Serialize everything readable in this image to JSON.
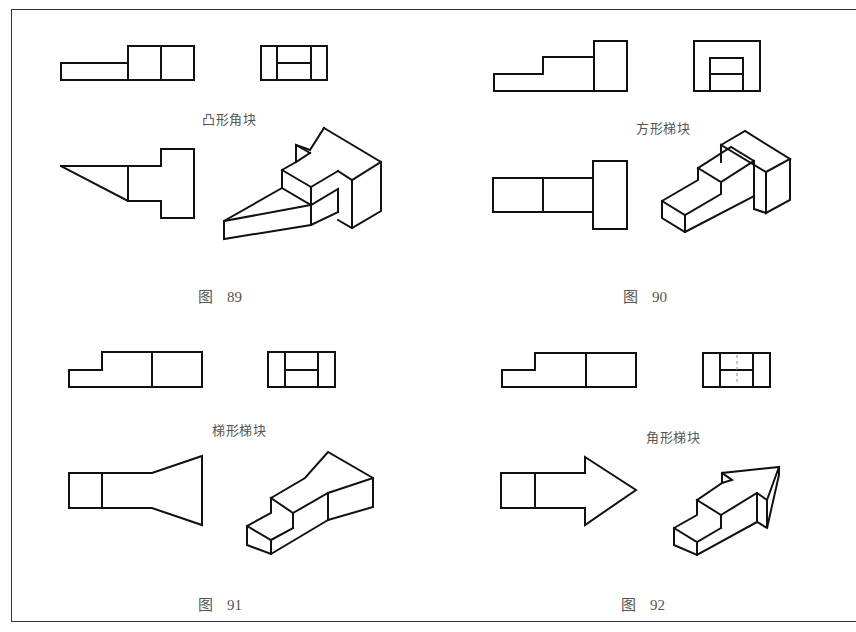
{
  "figures": [
    {
      "id": "89",
      "caption_prefix": "图",
      "caption_number": "89",
      "label": "凸形角块"
    },
    {
      "id": "90",
      "caption_prefix": "图",
      "caption_number": "90",
      "label": "方形梯块"
    },
    {
      "id": "91",
      "caption_prefix": "图",
      "caption_number": "91",
      "label": "梯形梯块"
    },
    {
      "id": "92",
      "caption_prefix": "图",
      "caption_number": "92",
      "label": "角形梯块"
    }
  ],
  "colors": {
    "line": "#111111",
    "text": "#555555",
    "background": "#ffffff"
  }
}
